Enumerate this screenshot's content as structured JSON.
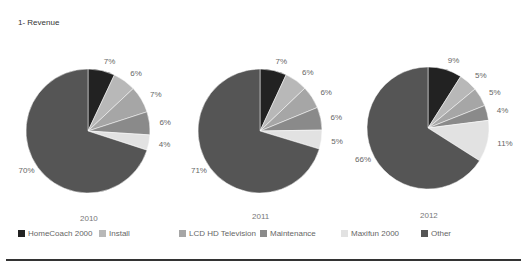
{
  "title": "1- Revenue",
  "colors": {
    "HomeCoach 2000": "#222222",
    "Install": "#b8b8b8",
    "LCD HD Television": "#a6a6a6",
    "Maintenance": "#8a8a8a",
    "Maxifun 2000": "#e2e2e2",
    "Other": "#555555"
  },
  "legend": [
    {
      "label": "HomeCoach 2000",
      "color": "#222222"
    },
    {
      "label": "Install",
      "color": "#b8b8b8"
    },
    {
      "label": "LCD HD Television",
      "color": "#a6a6a6"
    },
    {
      "label": "Maintenance",
      "color": "#8a8a8a"
    },
    {
      "label": "Maxifun 2000",
      "color": "#e2e2e2"
    },
    {
      "label": "Other",
      "color": "#555555"
    }
  ],
  "years": [
    "2010",
    "2011",
    "2012"
  ],
  "chart_data": {
    "type": "pie",
    "title": "1- Revenue",
    "categories": [
      "HomeCoach 2000",
      "Install",
      "LCD HD Television",
      "Maintenance",
      "Maxifun 2000",
      "Other"
    ],
    "legend_position": "bottom",
    "series": [
      {
        "name": "2010",
        "values": [
          7,
          6,
          7,
          6,
          4,
          70
        ],
        "labels": [
          "7%",
          "6%",
          "7%",
          "6%",
          "4%",
          "70%"
        ]
      },
      {
        "name": "2011",
        "values": [
          7,
          6,
          6,
          6,
          5,
          71
        ],
        "labels": [
          "7%",
          "6%",
          "6%",
          "6%",
          "5%",
          "71%"
        ]
      },
      {
        "name": "2012",
        "values": [
          9,
          5,
          5,
          4,
          11,
          66
        ],
        "labels": [
          "9%",
          "5%",
          "5%",
          "4%",
          "11%",
          "66%"
        ]
      }
    ]
  }
}
